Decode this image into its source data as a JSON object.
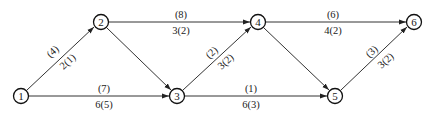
{
  "diagram": {
    "type": "network-graph",
    "nodes": [
      {
        "id": "1",
        "label": "1",
        "x": 21,
        "y": 96
      },
      {
        "id": "2",
        "label": "2",
        "x": 101,
        "y": 22
      },
      {
        "id": "3",
        "label": "3",
        "x": 177,
        "y": 96
      },
      {
        "id": "4",
        "label": "4",
        "x": 258,
        "y": 22
      },
      {
        "id": "5",
        "label": "5",
        "x": 335,
        "y": 96
      },
      {
        "id": "6",
        "label": "6",
        "x": 414,
        "y": 22
      }
    ],
    "edges": [
      {
        "from": "1",
        "to": "2",
        "top_label": "(4)",
        "bottom_label": "2(1)"
      },
      {
        "from": "1",
        "to": "3",
        "top_label": "(7)",
        "bottom_label": "6(5)"
      },
      {
        "from": "2",
        "to": "4",
        "top_label": "(8)",
        "bottom_label": "3(2)"
      },
      {
        "from": "2",
        "to": "3",
        "top_label": "",
        "bottom_label": ""
      },
      {
        "from": "3",
        "to": "4",
        "top_label": "(2)",
        "bottom_label": "3(2)"
      },
      {
        "from": "3",
        "to": "5",
        "top_label": "(1)",
        "bottom_label": "6(3)"
      },
      {
        "from": "4",
        "to": "6",
        "top_label": "(6)",
        "bottom_label": "4(2)"
      },
      {
        "from": "4",
        "to": "5",
        "top_label": "",
        "bottom_label": ""
      },
      {
        "from": "5",
        "to": "6",
        "top_label": "(3)",
        "bottom_label": "3(2)"
      }
    ]
  }
}
